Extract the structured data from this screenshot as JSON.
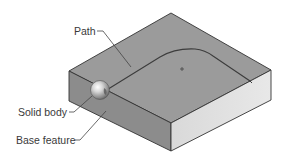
{
  "diagram": {
    "type": "isometric-cad-sweep-illustration",
    "labels": {
      "path": "Path",
      "solid_body": "Solid body",
      "base_feature": "Base feature"
    },
    "colors": {
      "top_face": "#9a9a9a",
      "left_face": "#8a8a8a",
      "right_face": "#d6d6d6",
      "edge": "#333333",
      "path_line": "#3c3c3c",
      "sphere_highlight": "#f2f2f2",
      "sphere_shadow": "#6f6f6f",
      "label_text": "#3a3a3a",
      "background": "#ffffff"
    }
  }
}
